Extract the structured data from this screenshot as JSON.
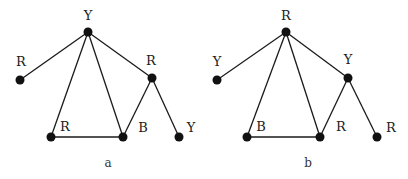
{
  "graphs": [
    {
      "caption": "a",
      "caption_pos": [
        108,
        167
      ],
      "nodes": [
        {
          "id": "top",
          "label": "Y",
          "x": 88,
          "y": 32,
          "lx": 88,
          "ly": 20
        },
        {
          "id": "left",
          "label": "R",
          "x": 20,
          "y": 80,
          "lx": 21,
          "ly": 66
        },
        {
          "id": "right",
          "label": "R",
          "x": 152,
          "y": 78,
          "lx": 151,
          "ly": 65
        },
        {
          "id": "bl",
          "label": "R",
          "x": 51,
          "y": 137,
          "lx": 65,
          "ly": 131
        },
        {
          "id": "bm",
          "label": "B",
          "x": 123,
          "y": 137,
          "lx": 143,
          "ly": 132
        },
        {
          "id": "br",
          "label": "Y",
          "x": 179,
          "y": 137,
          "lx": 191,
          "ly": 132
        }
      ],
      "edges": [
        [
          "top",
          "left"
        ],
        [
          "top",
          "bl"
        ],
        [
          "top",
          "bm"
        ],
        [
          "top",
          "right"
        ],
        [
          "bl",
          "bm"
        ],
        [
          "right",
          "bm"
        ],
        [
          "right",
          "br"
        ]
      ]
    },
    {
      "caption": "b",
      "caption_pos": [
        308,
        167
      ],
      "nodes": [
        {
          "id": "top",
          "label": "R",
          "x": 286,
          "y": 32,
          "lx": 286,
          "ly": 20
        },
        {
          "id": "left",
          "label": "Y",
          "x": 217,
          "y": 80,
          "lx": 217,
          "ly": 66
        },
        {
          "id": "right",
          "label": "Y",
          "x": 348,
          "y": 78,
          "lx": 348,
          "ly": 64
        },
        {
          "id": "bl",
          "label": "B",
          "x": 247,
          "y": 137,
          "lx": 261,
          "ly": 131
        },
        {
          "id": "bm",
          "label": "R",
          "x": 320,
          "y": 137,
          "lx": 341,
          "ly": 131
        },
        {
          "id": "br",
          "label": "R",
          "x": 377,
          "y": 137,
          "lx": 391,
          "ly": 132
        }
      ],
      "edges": [
        [
          "top",
          "left"
        ],
        [
          "top",
          "bl"
        ],
        [
          "top",
          "bm"
        ],
        [
          "top",
          "right"
        ],
        [
          "bl",
          "bm"
        ],
        [
          "right",
          "bm"
        ],
        [
          "right",
          "br"
        ]
      ]
    }
  ],
  "colors": {
    "node": "#111111",
    "edge": "#1a1a1a",
    "label": "#222222"
  }
}
